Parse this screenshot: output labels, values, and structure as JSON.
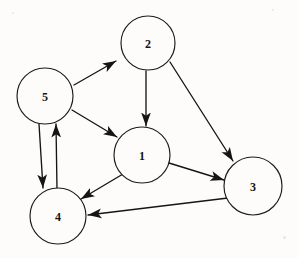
{
  "figure": {
    "background_color": "#fdfcfa",
    "stroke_color": "#151515",
    "width": 298,
    "height": 258
  },
  "nodes": [
    {
      "id": "1",
      "label": "1",
      "cx": 142,
      "cy": 155,
      "r": 28
    },
    {
      "id": "2",
      "label": "2",
      "cx": 148,
      "cy": 43,
      "r": 27
    },
    {
      "id": "3",
      "label": "3",
      "cx": 253,
      "cy": 186,
      "r": 29
    },
    {
      "id": "4",
      "label": "4",
      "cx": 58,
      "cy": 216,
      "r": 28
    },
    {
      "id": "5",
      "label": "5",
      "cx": 45,
      "cy": 96,
      "r": 28
    }
  ],
  "edges": [
    {
      "id": "e-5-2",
      "from": "5",
      "to": "2",
      "directed": true,
      "x1": 74,
      "y1": 85,
      "x2": 116,
      "y2": 61
    },
    {
      "id": "e-5-1",
      "from": "5",
      "to": "1",
      "directed": true,
      "x1": 72,
      "y1": 110,
      "x2": 117,
      "y2": 137
    },
    {
      "id": "e-2-1",
      "from": "2",
      "to": "1",
      "directed": true,
      "x1": 146,
      "y1": 71,
      "x2": 146,
      "y2": 126
    },
    {
      "id": "e-2-3",
      "from": "2",
      "to": "3",
      "directed": true,
      "x1": 170,
      "y1": 62,
      "x2": 233,
      "y2": 161
    },
    {
      "id": "e-1-3",
      "from": "1",
      "to": "3",
      "directed": true,
      "x1": 169,
      "y1": 163,
      "x2": 224,
      "y2": 180
    },
    {
      "id": "e-1-4",
      "from": "1",
      "to": "4",
      "directed": true,
      "x1": 123,
      "y1": 174,
      "x2": 81,
      "y2": 199
    },
    {
      "id": "e-3-4",
      "from": "3",
      "to": "4",
      "directed": true,
      "x1": 228,
      "y1": 198,
      "x2": 88,
      "y2": 215
    },
    {
      "id": "e-5-4",
      "from": "5",
      "to": "4",
      "directed": true,
      "x1": 39,
      "y1": 124,
      "x2": 43,
      "y2": 188
    },
    {
      "id": "e-4-5",
      "from": "4",
      "to": "5",
      "directed": true,
      "x1": 57,
      "y1": 190,
      "x2": 56,
      "y2": 124
    }
  ],
  "chart_data": {
    "type": "diagram",
    "graph_type": "directed",
    "vertices": [
      "1",
      "2",
      "3",
      "4",
      "5"
    ],
    "arcs": [
      [
        "5",
        "2"
      ],
      [
        "5",
        "1"
      ],
      [
        "5",
        "4"
      ],
      [
        "4",
        "5"
      ],
      [
        "2",
        "1"
      ],
      [
        "2",
        "3"
      ],
      [
        "1",
        "3"
      ],
      [
        "1",
        "4"
      ],
      [
        "3",
        "4"
      ]
    ]
  }
}
